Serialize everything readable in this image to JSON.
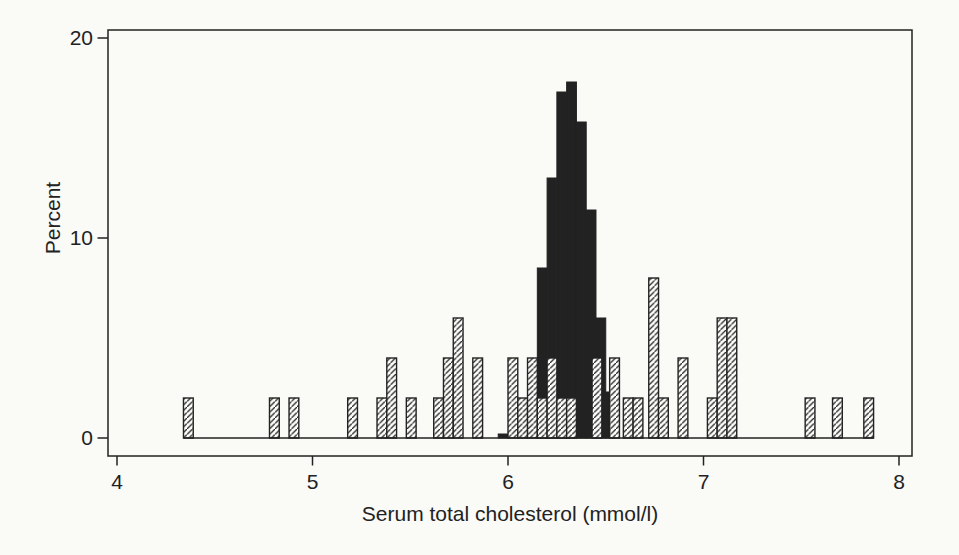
{
  "figure": {
    "background": "#fafaf7",
    "ink": "#222222",
    "paper": "#fdfdfb"
  },
  "chart_data": {
    "type": "bar",
    "subtype": "overlaid-histograms",
    "title": "",
    "xlabel": "Serum total cholesterol (mmol/l)",
    "ylabel": "Percent",
    "xlim": [
      4,
      8
    ],
    "ylim": [
      0,
      20
    ],
    "x_ticks": [
      "4",
      "5",
      "6",
      "7",
      "8"
    ],
    "y_ticks": [
      "0",
      "10",
      "20"
    ],
    "bin_width": 0.05,
    "grid": false,
    "legend": "none",
    "series": [
      {
        "name": "narrow-distribution-solid-black",
        "style": "solid",
        "bars": [
          [
            5.95,
            0.2
          ],
          [
            6.15,
            8.5
          ],
          [
            6.2,
            13.0
          ],
          [
            6.25,
            17.3
          ],
          [
            6.3,
            17.8
          ],
          [
            6.35,
            15.8
          ],
          [
            6.4,
            11.4
          ],
          [
            6.45,
            6.0
          ],
          [
            6.5,
            2.3
          ]
        ]
      },
      {
        "name": "wide-distribution-hatched",
        "style": "hatched",
        "bars": [
          [
            4.34,
            2
          ],
          [
            4.78,
            2
          ],
          [
            4.88,
            2
          ],
          [
            5.18,
            2
          ],
          [
            5.33,
            2
          ],
          [
            5.38,
            4
          ],
          [
            5.48,
            2
          ],
          [
            5.62,
            2
          ],
          [
            5.67,
            4
          ],
          [
            5.72,
            6
          ],
          [
            5.82,
            4
          ],
          [
            6.0,
            4
          ],
          [
            6.05,
            2
          ],
          [
            6.1,
            4
          ],
          [
            6.15,
            2
          ],
          [
            6.2,
            4
          ],
          [
            6.25,
            2
          ],
          [
            6.3,
            2
          ],
          [
            6.43,
            4
          ],
          [
            6.52,
            4
          ],
          [
            6.59,
            2
          ],
          [
            6.64,
            2
          ],
          [
            6.72,
            8
          ],
          [
            6.77,
            2
          ],
          [
            6.87,
            4
          ],
          [
            7.02,
            2
          ],
          [
            7.07,
            6
          ],
          [
            7.12,
            6
          ],
          [
            7.52,
            2
          ],
          [
            7.66,
            2
          ],
          [
            7.82,
            2
          ]
        ]
      }
    ]
  }
}
